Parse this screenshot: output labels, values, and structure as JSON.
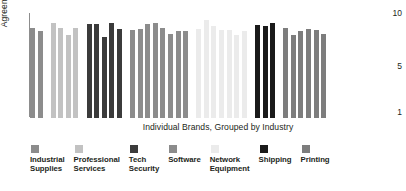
{
  "chart_data": {
    "type": "bar",
    "title": "",
    "xlabel": "Individual Brands, Grouped by Industry",
    "ylabel": "Agreement",
    "ylim": [
      1,
      10
    ],
    "yticks": [
      "10",
      "5",
      "1"
    ],
    "grid": false,
    "legend_position": "bottom",
    "groups": [
      {
        "name": "Industrial Supplies",
        "legend_label": "Industrial\nSupplies",
        "color": "#8c8c8c",
        "values": [
          8.4,
          8.1
        ]
      },
      {
        "name": "Professional Services",
        "legend_label": "Professional\nServices",
        "color": "#c2c2c2",
        "values": [
          8.8,
          8.4,
          7.8,
          8.4
        ]
      },
      {
        "name": "Tech Security",
        "legend_label": "Tech\nSecurity",
        "color": "#3b3b3b",
        "values": [
          8.7,
          8.7,
          7.6,
          8.8,
          8.3
        ]
      },
      {
        "name": "Software",
        "legend_label": "Software",
        "color": "#8c8c8c",
        "values": [
          8.2,
          8.3,
          8.7,
          8.8,
          8.4,
          7.9,
          8.1,
          8.1
        ]
      },
      {
        "name": "Network Equipment",
        "legend_label": "Network\nEquipment",
        "color": "#ebebeb",
        "values": [
          8.3,
          9.0,
          8.5,
          8.2,
          8.2,
          7.8,
          8.1
        ]
      },
      {
        "name": "Shipping",
        "legend_label": "Shipping",
        "color": "#1a1a1a",
        "values": [
          8.6,
          8.5,
          8.8
        ]
      },
      {
        "name": "Printing",
        "legend_label": "Printing",
        "color": "#7d7d7d",
        "values": [
          8.4,
          7.8,
          8.1,
          8.3,
          8.2,
          7.9
        ]
      }
    ]
  }
}
